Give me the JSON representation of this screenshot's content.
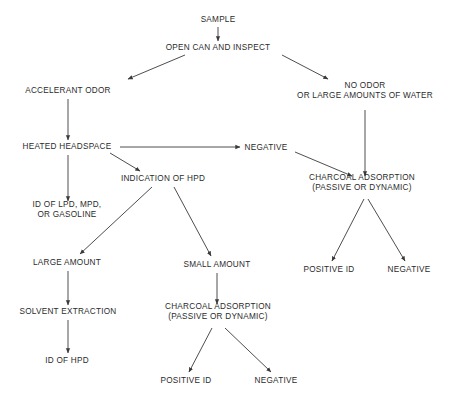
{
  "diagram": {
    "text_color": "#2b2b2b",
    "line_color": "#3a3a3a",
    "background": "#ffffff",
    "nodes": [
      {
        "id": "sample",
        "label": "SAMPLE",
        "x": 218,
        "y": 20
      },
      {
        "id": "open_can",
        "label": "OPEN CAN AND INSPECT",
        "x": 218,
        "y": 48
      },
      {
        "id": "accelerant_odor",
        "label": "ACCELERANT ODOR",
        "x": 68,
        "y": 91
      },
      {
        "id": "no_odor",
        "label": "NO ODOR",
        "label2": "OR LARGE AMOUNTS OF WATER",
        "x": 365,
        "y": 91
      },
      {
        "id": "heated_headspace",
        "label": "HEATED HEADSPACE",
        "x": 67,
        "y": 147
      },
      {
        "id": "negative_top",
        "label": "NEGATIVE",
        "x": 266,
        "y": 148
      },
      {
        "id": "indication_hpd",
        "label": "INDICATION OF HPD",
        "x": 163,
        "y": 179
      },
      {
        "id": "charcoal_right",
        "label": "CHARCOAL ADSORPTION",
        "label2": "(PASSIVE OR DYNAMIC)",
        "x": 362,
        "y": 183
      },
      {
        "id": "id_lpd_mpd",
        "label": "ID OF LPD, MPD,",
        "label2": "OR GASOLINE",
        "x": 67,
        "y": 210
      },
      {
        "id": "large_amount",
        "label": "LARGE AMOUNT",
        "x": 67,
        "y": 263
      },
      {
        "id": "small_amount",
        "label": "SMALL AMOUNT",
        "x": 217,
        "y": 265
      },
      {
        "id": "positive_id_right",
        "label": "POSITIVE ID",
        "x": 329,
        "y": 270
      },
      {
        "id": "negative_right",
        "label": "NEGATIVE",
        "x": 409,
        "y": 270
      },
      {
        "id": "solvent_extraction",
        "label": "SOLVENT EXTRACTION",
        "x": 68,
        "y": 312
      },
      {
        "id": "charcoal_bottom",
        "label": "CHARCOAL ADSORPTION",
        "label2": "(PASSIVE OR DYNAMIC)",
        "x": 218,
        "y": 312
      },
      {
        "id": "id_hpd",
        "label": "ID OF HPD",
        "x": 67,
        "y": 361
      },
      {
        "id": "positive_id_bottom",
        "label": "POSITIVE ID",
        "x": 186,
        "y": 381
      },
      {
        "id": "negative_bottom",
        "label": "NEGATIVE",
        "x": 276,
        "y": 381
      }
    ],
    "edges": [
      {
        "from": "sample",
        "to": "open_can",
        "x1": 218,
        "y1": 27,
        "x2": 218,
        "y2": 41
      },
      {
        "from": "open_can",
        "to": "accelerant_odor",
        "x1": 185,
        "y1": 55,
        "x2": 128,
        "y2": 79
      },
      {
        "from": "open_can",
        "to": "no_odor",
        "x1": 282,
        "y1": 55,
        "x2": 328,
        "y2": 79
      },
      {
        "from": "accelerant_odor",
        "to": "heated_headspace",
        "x1": 68,
        "y1": 99,
        "x2": 68,
        "y2": 140
      },
      {
        "from": "no_odor",
        "to": "charcoal_right",
        "x1": 365,
        "y1": 110,
        "x2": 365,
        "y2": 176
      },
      {
        "from": "heated_headspace",
        "to": "negative_top",
        "x1": 120,
        "y1": 147,
        "x2": 240,
        "y2": 147
      },
      {
        "from": "heated_headspace",
        "to": "indication_hpd",
        "x1": 110,
        "y1": 153,
        "x2": 140,
        "y2": 171
      },
      {
        "from": "heated_headspace",
        "to": "id_lpd_mpd",
        "x1": 68,
        "y1": 155,
        "x2": 68,
        "y2": 201
      },
      {
        "from": "negative_top",
        "to": "charcoal_right",
        "x1": 295,
        "y1": 152,
        "x2": 352,
        "y2": 176
      },
      {
        "from": "indication_hpd",
        "to": "large_amount",
        "x1": 152,
        "y1": 187,
        "x2": 80,
        "y2": 254
      },
      {
        "from": "indication_hpd",
        "to": "small_amount",
        "x1": 174,
        "y1": 187,
        "x2": 211,
        "y2": 256
      },
      {
        "from": "charcoal_right",
        "to": "positive_id_right",
        "x1": 364,
        "y1": 199,
        "x2": 332,
        "y2": 261
      },
      {
        "from": "charcoal_right",
        "to": "negative_right",
        "x1": 368,
        "y1": 199,
        "x2": 405,
        "y2": 261
      },
      {
        "from": "large_amount",
        "to": "solvent_extraction",
        "x1": 68,
        "y1": 271,
        "x2": 68,
        "y2": 305
      },
      {
        "from": "small_amount",
        "to": "charcoal_bottom",
        "x1": 217,
        "y1": 273,
        "x2": 217,
        "y2": 304
      },
      {
        "from": "solvent_extraction",
        "to": "id_hpd",
        "x1": 68,
        "y1": 320,
        "x2": 68,
        "y2": 353
      },
      {
        "from": "charcoal_bottom",
        "to": "positive_id_bottom",
        "x1": 212,
        "y1": 328,
        "x2": 189,
        "y2": 372
      },
      {
        "from": "charcoal_bottom",
        "to": "negative_bottom",
        "x1": 225,
        "y1": 328,
        "x2": 271,
        "y2": 372
      }
    ]
  }
}
